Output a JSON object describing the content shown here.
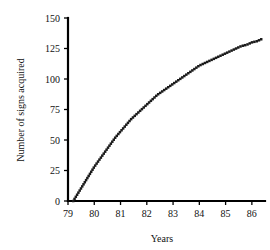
{
  "chart_data": {
    "type": "line",
    "title": "",
    "subtitle": "",
    "xlabel": "Years",
    "ylabel": "Number of signs acquired",
    "xlim": [
      78.6,
      86.5
    ],
    "ylim": [
      0,
      150
    ],
    "xticks": [
      "79",
      "80",
      "81",
      "82",
      "83",
      "84",
      "85",
      "86"
    ],
    "xtick_values": [
      79,
      80,
      81,
      82,
      83,
      84,
      85,
      86
    ],
    "yticks": [
      "0",
      "25",
      "50",
      "75",
      "100",
      "125",
      "150"
    ],
    "ytick_values": [
      0,
      25,
      50,
      75,
      100,
      125,
      150
    ],
    "grid": false,
    "legend": null,
    "legend_position": "none",
    "annotations": [],
    "series": [
      {
        "name": "Cumulative signs acquired",
        "style": "dotted",
        "color": "#1a1a1a",
        "x": [
          79.2,
          79.4,
          79.6,
          79.8,
          80.0,
          80.2,
          80.4,
          80.6,
          80.8,
          81.0,
          81.2,
          81.4,
          81.6,
          81.8,
          82.0,
          82.2,
          82.4,
          82.6,
          82.8,
          83.0,
          83.2,
          83.4,
          83.6,
          83.8,
          84.0,
          84.2,
          84.4,
          84.6,
          84.8,
          85.0,
          85.2,
          85.4,
          85.6,
          85.8,
          86.0,
          86.2,
          86.4
        ],
        "values": [
          0,
          7,
          14,
          21,
          28,
          34,
          40,
          46,
          52,
          57,
          62,
          67,
          71,
          75,
          79,
          83,
          87,
          90,
          93,
          96,
          99,
          102,
          105,
          108,
          111,
          113,
          115,
          117,
          119,
          121,
          123,
          125,
          127,
          128,
          130,
          131,
          133
        ]
      }
    ]
  },
  "axes": {
    "x_title": "Years",
    "y_title": "Number of signs acquired"
  }
}
